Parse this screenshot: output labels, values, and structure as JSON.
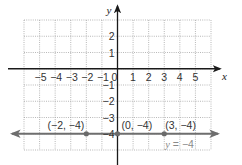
{
  "chart_data": {
    "type": "line",
    "title": "",
    "xlabel": "x",
    "ylabel": "y",
    "xlim": [
      -6,
      6
    ],
    "ylim": [
      -5,
      3
    ],
    "grid": true,
    "x_ticks": [
      {
        "value": -5,
        "label": "−5"
      },
      {
        "value": -4,
        "label": "−4"
      },
      {
        "value": -3,
        "label": "−3"
      },
      {
        "value": -2,
        "label": "−2"
      },
      {
        "value": -1,
        "label": "−1"
      },
      {
        "value": 0,
        "label": "0"
      },
      {
        "value": 1,
        "label": "1"
      },
      {
        "value": 2,
        "label": "2"
      },
      {
        "value": 3,
        "label": "3"
      },
      {
        "value": 4,
        "label": "4"
      },
      {
        "value": 5,
        "label": "5"
      }
    ],
    "y_ticks": [
      {
        "value": 2,
        "label": "2"
      },
      {
        "value": 1,
        "label": "1"
      },
      {
        "value": -1,
        "label": "−1"
      },
      {
        "value": -2,
        "label": "−2"
      },
      {
        "value": -3,
        "label": "−3"
      },
      {
        "value": -4,
        "label": "−4"
      }
    ],
    "series": [
      {
        "name": "y = −4",
        "equation_var": "y",
        "equation_rest": " = −4",
        "kind": "horizontal-line",
        "y": -4,
        "color": "#6e6e6e",
        "arrows": "both"
      }
    ],
    "points": [
      {
        "x": -2,
        "y": -4,
        "label": "(−2, −4)"
      },
      {
        "x": 0,
        "y": -4,
        "label": "(0, −4)"
      },
      {
        "x": 3,
        "y": -4,
        "label": "(3, −4)"
      }
    ]
  }
}
